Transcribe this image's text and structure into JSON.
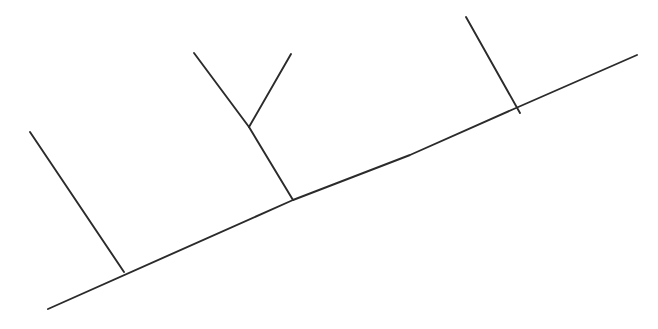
{
  "canvas": {
    "width": 658,
    "height": 329,
    "background_color": "#ffffff",
    "title": "Hand-drawn line diagram"
  },
  "style": {
    "stroke_color": "#2b2b2b",
    "stroke_width": 1.9,
    "stroke_linecap": "round"
  },
  "chart_data": {
    "type": "line",
    "xlabel": "",
    "ylabel": "",
    "xlim": [
      0,
      658
    ],
    "ylim": [
      0,
      329
    ],
    "grid": false,
    "legend": "none",
    "note": "Pixel coordinates, origin at top-left, y increases downward",
    "series": [
      {
        "name": "main-diagonal-line",
        "points": [
          [
            48,
            309
          ],
          [
            293,
            200
          ],
          [
            410,
            155
          ],
          [
            516,
            108
          ],
          [
            637,
            55
          ]
        ]
      },
      {
        "name": "left-branch",
        "points": [
          [
            30,
            132
          ],
          [
            124,
            272
          ]
        ]
      },
      {
        "name": "center-stem",
        "points": [
          [
            249,
            127
          ],
          [
            293,
            200
          ]
        ]
      },
      {
        "name": "center-fork-left-arm",
        "points": [
          [
            194,
            53
          ],
          [
            249,
            127
          ]
        ]
      },
      {
        "name": "center-fork-right-arm",
        "points": [
          [
            291,
            54
          ],
          [
            249,
            127
          ]
        ]
      },
      {
        "name": "right-branch",
        "points": [
          [
            466,
            17
          ],
          [
            520,
            113
          ]
        ]
      }
    ]
  }
}
